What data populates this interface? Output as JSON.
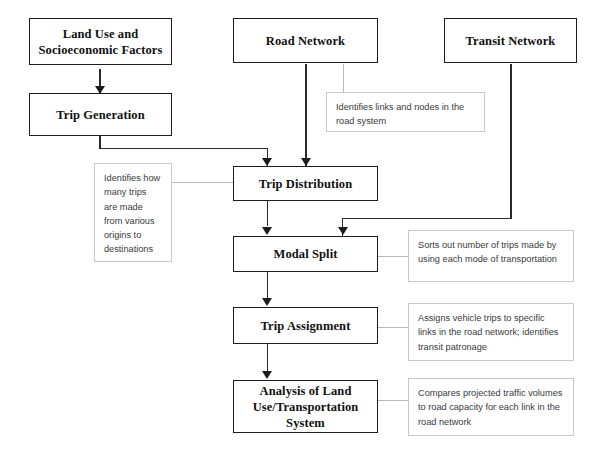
{
  "diagram": {
    "colors": {
      "node_border": "#1c1c1c",
      "note_border": "#c9c9c9",
      "connector": "#2a2a2a",
      "connector_light": "#b9b9b9",
      "background": "#ffffff",
      "text": "#111111",
      "note_text": "#3a3a3a"
    },
    "nodes": [
      {
        "id": "land-use",
        "label_line1": "Land Use and",
        "label_line2": "Socioeconomic Factors"
      },
      {
        "id": "road-network",
        "label_line1": "Road Network"
      },
      {
        "id": "transit-network",
        "label_line1": "Transit Network"
      },
      {
        "id": "trip-generation",
        "label_line1": "Trip Generation"
      },
      {
        "id": "trip-distribution",
        "label_line1": "Trip Distribution"
      },
      {
        "id": "modal-split",
        "label_line1": "Modal Split"
      },
      {
        "id": "trip-assignment",
        "label_line1": "Trip Assignment"
      },
      {
        "id": "analysis",
        "label_line1": "Analysis of Land",
        "label_line2": "Use/Transportation",
        "label_line3": "System"
      }
    ],
    "notes": [
      {
        "id": "note-road-network",
        "text": "Identifies links and nodes in the road system"
      },
      {
        "id": "note-trip-distribution",
        "text": "Identifies how many trips are made from various origins to destinations"
      },
      {
        "id": "note-modal-split",
        "text": "Sorts out number of trips made by using each mode of transportation"
      },
      {
        "id": "note-trip-assignment",
        "text": "Assigns vehicle trips to specific links in the road network; identifies transit patronage"
      },
      {
        "id": "note-analysis",
        "text": "Compares projected traffic volumes to road capacity for each link in the road network"
      }
    ]
  }
}
